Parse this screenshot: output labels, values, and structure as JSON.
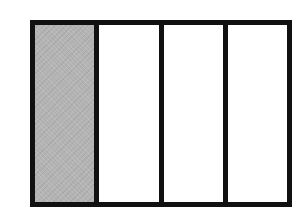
{
  "diagram": {
    "type": "fraction-rectangle",
    "total_parts": 4,
    "shaded_parts": 1,
    "fraction": "1/4",
    "orientation": "vertical-columns",
    "parts": [
      {
        "index": 0,
        "shaded": true
      },
      {
        "index": 1,
        "shaded": false
      },
      {
        "index": 2,
        "shaded": false
      },
      {
        "index": 3,
        "shaded": false
      }
    ],
    "colors": {
      "border": "#111111",
      "shaded_fill": "#b3b3b3",
      "unshaded_fill": "#ffffff",
      "background": "#ffffff"
    }
  }
}
